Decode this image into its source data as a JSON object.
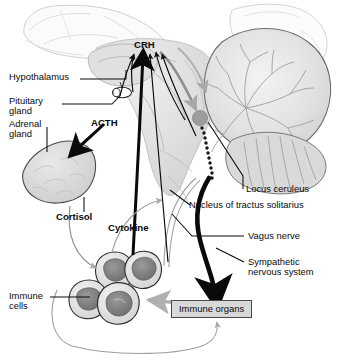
{
  "figure": {
    "background_color": "#ffffff"
  },
  "labels": {
    "crh": "CRH",
    "hypothalamus": "Hypothalamus",
    "pituitary_gland_line1": "Pituitary",
    "pituitary_gland_line2": "gland",
    "adrenal_gland_line1": "Adrenal",
    "adrenal_gland_line2": "gland",
    "acth": "ACTH",
    "cortisol": "Cortisol",
    "cytokine": "Cytokine",
    "locus_ceruleus": "Locus ceruleus",
    "nucleus_tractus_solitarius": "Nucleus of tractus solitarius",
    "vagus_nerve": "Vagus nerve",
    "sympathetic_line1": "Sympathetic",
    "sympathetic_line2": "nervous system",
    "immune_cells_line1": "Immune",
    "immune_cells_line2": "cells",
    "immune_organs": "Immune organs"
  },
  "colors": {
    "ink": "#0a0a0a",
    "outline": "#3d3d3d",
    "tissue_light": "#ebebeb",
    "tissue_mid": "#d6d6d6",
    "tissue_dark": "#b9b9b9",
    "nucleus_dark": "#8a8a8a",
    "gray_arrow": "#a8a8a8",
    "box_fill": "#d9d9d9",
    "box_border": "#4a4a4a",
    "leader_line": "#111111"
  },
  "structures": [
    {
      "name": "cerebrum",
      "type": "outline-faint"
    },
    {
      "name": "cerebellum",
      "type": "foliated-mass"
    },
    {
      "name": "brainstem",
      "type": "shaded-mass"
    },
    {
      "name": "hypothalamus",
      "type": "shaded-mass"
    },
    {
      "name": "pituitary-gland",
      "type": "small-oval"
    },
    {
      "name": "adrenal-gland",
      "type": "mottled-blob"
    },
    {
      "name": "locus-ceruleus",
      "type": "gray-disc"
    },
    {
      "name": "spinal-cord-chain",
      "type": "dotted-chain"
    },
    {
      "name": "immune-cell-cluster",
      "type": "four-cells"
    },
    {
      "name": "immune-organs-box",
      "type": "labeled-box"
    }
  ],
  "arrows": [
    {
      "name": "acth-arrow",
      "style": "thick-black",
      "from": "pituitary-gland",
      "to": "adrenal-gland"
    },
    {
      "name": "cytokine-arrow",
      "style": "thick-black",
      "from": "immune-cells",
      "to": "crh"
    },
    {
      "name": "vagus-afferent-arrow",
      "style": "thin-black",
      "from": "vagus-nerve",
      "to": "crh"
    },
    {
      "name": "locus-ceruleus-arrow",
      "style": "thin-black",
      "from": "crh",
      "to": "locus-ceruleus"
    },
    {
      "name": "sympathetic-arrow",
      "style": "thick-black-curve",
      "from": "brainstem",
      "to": "immune-organs"
    },
    {
      "name": "cortisol-arrow",
      "style": "thin-gray",
      "from": "adrenal-gland",
      "to": "immune-cells"
    },
    {
      "name": "immune-organs-feedback",
      "style": "thin-gray",
      "from": "immune-cells",
      "to": "immune-organs"
    },
    {
      "name": "immune-organs-to-cells-arrow",
      "style": "gray-block",
      "from": "immune-organs",
      "to": "immune-cells"
    }
  ]
}
